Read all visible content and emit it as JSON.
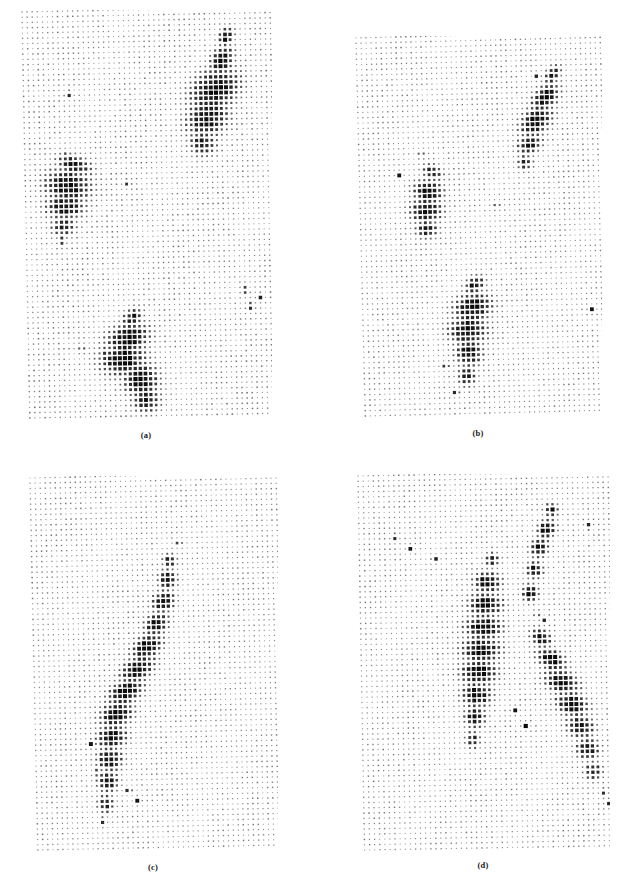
{
  "figure": {
    "title": "",
    "panel_count": 4,
    "background_color": "#ffffff",
    "dot_color": "#101010",
    "grid_faint_color": "#b9b9b9"
  },
  "chart_data": [
    {
      "type": "scatter",
      "id": "a",
      "label": "(a)",
      "title": "",
      "xlabel": "",
      "ylabel": "",
      "grid": true,
      "legend": "none",
      "description": "Hinton-style dot-size density map on a regular lattice; dot area encodes magnitude. Three dark blobs: upper-right elongated cluster, mid-left oval cluster, lower-centre large cluster.",
      "cols": 50,
      "rows": 78,
      "dot_size_min": 0.9,
      "dot_size_max": 4.2,
      "skew_deg": -1.1,
      "background_level": 0.13,
      "noise_seed": 1701,
      "blobs": [
        {
          "cx": 0.82,
          "cy": 0.07,
          "rx": 0.035,
          "ry": 0.022,
          "amp": 0.95,
          "rot": -25
        },
        {
          "cx": 0.8,
          "cy": 0.13,
          "rx": 0.055,
          "ry": 0.035,
          "amp": 1.0,
          "rot": -25
        },
        {
          "cx": 0.77,
          "cy": 0.2,
          "rx": 0.11,
          "ry": 0.055,
          "amp": 1.0,
          "rot": -12
        },
        {
          "cx": 0.74,
          "cy": 0.27,
          "rx": 0.095,
          "ry": 0.05,
          "amp": 0.95,
          "rot": -8
        },
        {
          "cx": 0.72,
          "cy": 0.33,
          "rx": 0.06,
          "ry": 0.035,
          "amp": 0.85,
          "rot": 0
        },
        {
          "cx": 0.2,
          "cy": 0.38,
          "rx": 0.075,
          "ry": 0.026,
          "amp": 0.9,
          "rot": 10
        },
        {
          "cx": 0.17,
          "cy": 0.43,
          "rx": 0.1,
          "ry": 0.045,
          "amp": 1.0,
          "rot": 4
        },
        {
          "cx": 0.16,
          "cy": 0.48,
          "rx": 0.085,
          "ry": 0.035,
          "amp": 0.95,
          "rot": 0
        },
        {
          "cx": 0.15,
          "cy": 0.53,
          "rx": 0.055,
          "ry": 0.026,
          "amp": 0.8,
          "rot": 0
        },
        {
          "cx": 0.42,
          "cy": 0.76,
          "rx": 0.045,
          "ry": 0.025,
          "amp": 0.9,
          "rot": -20
        },
        {
          "cx": 0.4,
          "cy": 0.81,
          "rx": 0.095,
          "ry": 0.04,
          "amp": 1.0,
          "rot": -8
        },
        {
          "cx": 0.38,
          "cy": 0.86,
          "rx": 0.1,
          "ry": 0.045,
          "amp": 1.0,
          "rot": 0
        },
        {
          "cx": 0.45,
          "cy": 0.91,
          "rx": 0.075,
          "ry": 0.045,
          "amp": 1.0,
          "rot": 0
        },
        {
          "cx": 0.47,
          "cy": 0.96,
          "rx": 0.06,
          "ry": 0.035,
          "amp": 0.9,
          "rot": 0
        }
      ],
      "outliers": [
        {
          "x": 0.18,
          "y": 0.205
        },
        {
          "x": 0.155,
          "y": 0.355
        },
        {
          "x": 0.145,
          "y": 0.565
        },
        {
          "x": 0.415,
          "y": 0.425
        },
        {
          "x": 0.215,
          "y": 0.835
        },
        {
          "x": 0.3,
          "y": 0.845
        },
        {
          "x": 0.88,
          "y": 0.695
        },
        {
          "x": 0.935,
          "y": 0.715
        },
        {
          "x": 0.895,
          "y": 0.735
        }
      ]
    },
    {
      "type": "scatter",
      "id": "b",
      "label": "(b)",
      "title": "",
      "xlabel": "",
      "ylabel": "",
      "grid": true,
      "legend": "none",
      "description": "Dot-size density map; upper-right diagonal cluster, middle-left oval cluster, lower-centre tall cluster.",
      "cols": 50,
      "rows": 72,
      "dot_size_min": 0.9,
      "dot_size_max": 4.2,
      "skew_deg": -1.4,
      "background_level": 0.12,
      "noise_seed": 90210,
      "blobs": [
        {
          "cx": 0.8,
          "cy": 0.11,
          "rx": 0.04,
          "ry": 0.022,
          "amp": 0.9,
          "rot": -30
        },
        {
          "cx": 0.77,
          "cy": 0.17,
          "rx": 0.065,
          "ry": 0.035,
          "amp": 1.0,
          "rot": -25
        },
        {
          "cx": 0.73,
          "cy": 0.23,
          "rx": 0.075,
          "ry": 0.04,
          "amp": 1.0,
          "rot": -18
        },
        {
          "cx": 0.7,
          "cy": 0.29,
          "rx": 0.055,
          "ry": 0.03,
          "amp": 0.9,
          "rot": -10
        },
        {
          "cx": 0.68,
          "cy": 0.34,
          "rx": 0.035,
          "ry": 0.022,
          "amp": 0.8,
          "rot": 0
        },
        {
          "cx": 0.3,
          "cy": 0.36,
          "rx": 0.045,
          "ry": 0.022,
          "amp": 0.85,
          "rot": 10
        },
        {
          "cx": 0.28,
          "cy": 0.41,
          "rx": 0.065,
          "ry": 0.032,
          "amp": 1.0,
          "rot": 5
        },
        {
          "cx": 0.27,
          "cy": 0.46,
          "rx": 0.07,
          "ry": 0.035,
          "amp": 1.0,
          "rot": 0
        },
        {
          "cx": 0.27,
          "cy": 0.51,
          "rx": 0.05,
          "ry": 0.026,
          "amp": 0.85,
          "rot": 0
        },
        {
          "cx": 0.46,
          "cy": 0.66,
          "rx": 0.045,
          "ry": 0.024,
          "amp": 0.9,
          "rot": -15
        },
        {
          "cx": 0.45,
          "cy": 0.72,
          "rx": 0.085,
          "ry": 0.04,
          "amp": 1.0,
          "rot": -6
        },
        {
          "cx": 0.43,
          "cy": 0.78,
          "rx": 0.085,
          "ry": 0.042,
          "amp": 1.0,
          "rot": 0
        },
        {
          "cx": 0.43,
          "cy": 0.84,
          "rx": 0.06,
          "ry": 0.038,
          "amp": 0.95,
          "rot": 0
        },
        {
          "cx": 0.42,
          "cy": 0.9,
          "rx": 0.04,
          "ry": 0.03,
          "amp": 0.85,
          "rot": 0
        }
      ],
      "outliers": [
        {
          "x": 0.74,
          "y": 0.115
        },
        {
          "x": 0.255,
          "y": 0.315
        },
        {
          "x": 0.165,
          "y": 0.365
        },
        {
          "x": 0.935,
          "y": 0.735
        },
        {
          "x": 0.335,
          "y": 0.875
        },
        {
          "x": 0.375,
          "y": 0.945
        },
        {
          "x": 0.56,
          "y": 0.455
        }
      ]
    },
    {
      "type": "scatter",
      "id": "c",
      "label": "(c)",
      "title": "",
      "xlabel": "",
      "ylabel": "",
      "grid": true,
      "legend": "none",
      "description": "Dot-size density map; one long diagonal band of dark dots running from upper-centre down to lower-left.",
      "cols": 50,
      "rows": 72,
      "dot_size_min": 0.9,
      "dot_size_max": 4.2,
      "skew_deg": -1.2,
      "background_level": 0.12,
      "noise_seed": 424242,
      "blobs": [
        {
          "cx": 0.56,
          "cy": 0.23,
          "rx": 0.03,
          "ry": 0.02,
          "amp": 0.85,
          "rot": 0
        },
        {
          "cx": 0.55,
          "cy": 0.28,
          "rx": 0.04,
          "ry": 0.028,
          "amp": 0.95,
          "rot": 0
        },
        {
          "cx": 0.53,
          "cy": 0.34,
          "rx": 0.05,
          "ry": 0.03,
          "amp": 1.0,
          "rot": -10
        },
        {
          "cx": 0.5,
          "cy": 0.4,
          "rx": 0.055,
          "ry": 0.032,
          "amp": 1.0,
          "rot": -15
        },
        {
          "cx": 0.46,
          "cy": 0.46,
          "rx": 0.07,
          "ry": 0.034,
          "amp": 1.0,
          "rot": -18
        },
        {
          "cx": 0.42,
          "cy": 0.52,
          "rx": 0.08,
          "ry": 0.036,
          "amp": 1.0,
          "rot": -18
        },
        {
          "cx": 0.37,
          "cy": 0.58,
          "rx": 0.08,
          "ry": 0.036,
          "amp": 1.0,
          "rot": -15
        },
        {
          "cx": 0.33,
          "cy": 0.64,
          "rx": 0.075,
          "ry": 0.036,
          "amp": 1.0,
          "rot": -10
        },
        {
          "cx": 0.31,
          "cy": 0.7,
          "rx": 0.065,
          "ry": 0.035,
          "amp": 1.0,
          "rot": -5
        },
        {
          "cx": 0.3,
          "cy": 0.76,
          "rx": 0.055,
          "ry": 0.034,
          "amp": 0.98,
          "rot": 0
        },
        {
          "cx": 0.29,
          "cy": 0.82,
          "rx": 0.045,
          "ry": 0.03,
          "amp": 0.92,
          "rot": 0
        },
        {
          "cx": 0.28,
          "cy": 0.88,
          "rx": 0.035,
          "ry": 0.026,
          "amp": 0.85,
          "rot": 0
        }
      ],
      "outliers": [
        {
          "x": 0.225,
          "y": 0.715
        },
        {
          "x": 0.245,
          "y": 0.795
        },
        {
          "x": 0.375,
          "y": 0.845
        },
        {
          "x": 0.41,
          "y": 0.875
        },
        {
          "x": 0.6,
          "y": 0.185
        },
        {
          "x": 0.265,
          "y": 0.925
        }
      ]
    },
    {
      "type": "scatter",
      "id": "d",
      "label": "(d)",
      "title": "",
      "xlabel": "",
      "ylabel": "",
      "grid": true,
      "legend": "none",
      "description": "Dot-size density map; two large adjacent clusters in the centre-right, plus a diagonal tail running to the lower-right corner.",
      "cols": 50,
      "rows": 72,
      "dot_size_min": 0.9,
      "dot_size_max": 4.2,
      "skew_deg": -1.0,
      "background_level": 0.12,
      "noise_seed": 31337,
      "blobs": [
        {
          "cx": 0.77,
          "cy": 0.1,
          "rx": 0.03,
          "ry": 0.02,
          "amp": 0.9,
          "rot": 0
        },
        {
          "cx": 0.75,
          "cy": 0.15,
          "rx": 0.04,
          "ry": 0.026,
          "amp": 1.0,
          "rot": -10
        },
        {
          "cx": 0.72,
          "cy": 0.2,
          "rx": 0.04,
          "ry": 0.026,
          "amp": 1.0,
          "rot": -10
        },
        {
          "cx": 0.7,
          "cy": 0.26,
          "rx": 0.035,
          "ry": 0.024,
          "amp": 0.95,
          "rot": 0
        },
        {
          "cx": 0.68,
          "cy": 0.32,
          "rx": 0.035,
          "ry": 0.026,
          "amp": 0.95,
          "rot": 0
        },
        {
          "cx": 0.53,
          "cy": 0.23,
          "rx": 0.03,
          "ry": 0.02,
          "amp": 0.85,
          "rot": 0
        },
        {
          "cx": 0.51,
          "cy": 0.29,
          "rx": 0.06,
          "ry": 0.03,
          "amp": 1.0,
          "rot": 0
        },
        {
          "cx": 0.5,
          "cy": 0.35,
          "rx": 0.075,
          "ry": 0.034,
          "amp": 1.0,
          "rot": 0
        },
        {
          "cx": 0.49,
          "cy": 0.41,
          "rx": 0.08,
          "ry": 0.036,
          "amp": 1.0,
          "rot": 0
        },
        {
          "cx": 0.48,
          "cy": 0.47,
          "rx": 0.085,
          "ry": 0.038,
          "amp": 1.0,
          "rot": 0
        },
        {
          "cx": 0.47,
          "cy": 0.53,
          "rx": 0.08,
          "ry": 0.038,
          "amp": 1.0,
          "rot": 0
        },
        {
          "cx": 0.46,
          "cy": 0.59,
          "rx": 0.065,
          "ry": 0.036,
          "amp": 0.98,
          "rot": 0
        },
        {
          "cx": 0.45,
          "cy": 0.65,
          "rx": 0.045,
          "ry": 0.032,
          "amp": 0.9,
          "rot": 0
        },
        {
          "cx": 0.44,
          "cy": 0.71,
          "rx": 0.03,
          "ry": 0.026,
          "amp": 0.8,
          "rot": 0
        },
        {
          "cx": 0.72,
          "cy": 0.44,
          "rx": 0.045,
          "ry": 0.026,
          "amp": 0.95,
          "rot": 15
        },
        {
          "cx": 0.76,
          "cy": 0.5,
          "rx": 0.065,
          "ry": 0.03,
          "amp": 1.0,
          "rot": 15
        },
        {
          "cx": 0.8,
          "cy": 0.56,
          "rx": 0.075,
          "ry": 0.034,
          "amp": 1.0,
          "rot": 12
        },
        {
          "cx": 0.84,
          "cy": 0.62,
          "rx": 0.07,
          "ry": 0.034,
          "amp": 1.0,
          "rot": 10
        },
        {
          "cx": 0.87,
          "cy": 0.68,
          "rx": 0.06,
          "ry": 0.032,
          "amp": 0.98,
          "rot": 5
        },
        {
          "cx": 0.9,
          "cy": 0.74,
          "rx": 0.05,
          "ry": 0.03,
          "amp": 0.92,
          "rot": 0
        },
        {
          "cx": 0.92,
          "cy": 0.8,
          "rx": 0.038,
          "ry": 0.026,
          "amp": 0.85,
          "rot": 0
        }
      ],
      "outliers": [
        {
          "x": 0.145,
          "y": 0.165
        },
        {
          "x": 0.205,
          "y": 0.195
        },
        {
          "x": 0.3,
          "y": 0.225
        },
        {
          "x": 0.92,
          "y": 0.145
        },
        {
          "x": 0.705,
          "y": 0.375
        },
        {
          "x": 0.73,
          "y": 0.395
        },
        {
          "x": 0.615,
          "y": 0.635
        },
        {
          "x": 0.655,
          "y": 0.675
        },
        {
          "x": 0.955,
          "y": 0.855
        },
        {
          "x": 0.985,
          "y": 0.885
        }
      ]
    }
  ]
}
